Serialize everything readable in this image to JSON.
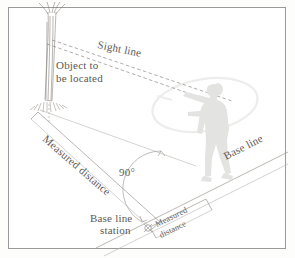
{
  "figure": {
    "background_color": "#ffffff",
    "frame_color": "#9a9a98",
    "label_color": "#5d5953"
  },
  "labels": {
    "sight_line": "Sight line",
    "object_line1": "Object to",
    "object_line2": "be located",
    "measured_distance_main": "Measured distance",
    "measured_distance_base_line1": "Measured",
    "measured_distance_base_line2": "distance",
    "base_line": "Base line",
    "angle": "90°",
    "station_line1": "Base line",
    "station_line2": "station"
  },
  "elements": {
    "tree": "tree-object",
    "observer": "observer-figure",
    "tape": "measuring-tape-loop",
    "station_marker": "base-line-station-marker"
  }
}
